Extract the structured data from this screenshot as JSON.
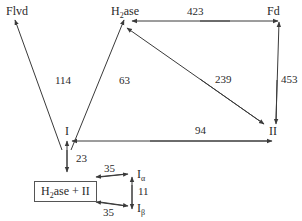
{
  "diagram": {
    "nodes": {
      "flvd": {
        "label": "Flvd"
      },
      "h2ase": {
        "label_main": "H",
        "label_sub": "2",
        "label_rest": "ase"
      },
      "fd": {
        "label": "Fd"
      },
      "i": {
        "label": "I"
      },
      "ii": {
        "label": "II"
      },
      "complex": {
        "label_main": "H",
        "label_sub": "2",
        "label_rest": "ase + II"
      },
      "i_alpha": {
        "label": "I",
        "sub": "α"
      },
      "i_beta": {
        "label": "I",
        "sub": "β"
      }
    },
    "edges": [
      {
        "from": "I",
        "to": "Flvd",
        "value": "114"
      },
      {
        "from": "I",
        "to": "H2ase",
        "value": "63"
      },
      {
        "from": "H2ase",
        "to": "Fd",
        "value": "423"
      },
      {
        "from": "H2ase",
        "to": "II",
        "value": "239"
      },
      {
        "from": "Fd",
        "to": "II",
        "value": "453"
      },
      {
        "from": "I",
        "to": "II",
        "value": "94"
      },
      {
        "from": "I",
        "to": "H2ase + II",
        "value": "23"
      },
      {
        "from": "H2ase + II",
        "to": "Iα",
        "value": "35"
      },
      {
        "from": "H2ase + II",
        "to": "Iβ",
        "value": "35"
      },
      {
        "from": "Iα",
        "to": "Iβ",
        "value": "11"
      }
    ],
    "colors": {
      "line": "#3a3a3a",
      "text": "#2a2a2a",
      "background": "#ffffff"
    }
  }
}
